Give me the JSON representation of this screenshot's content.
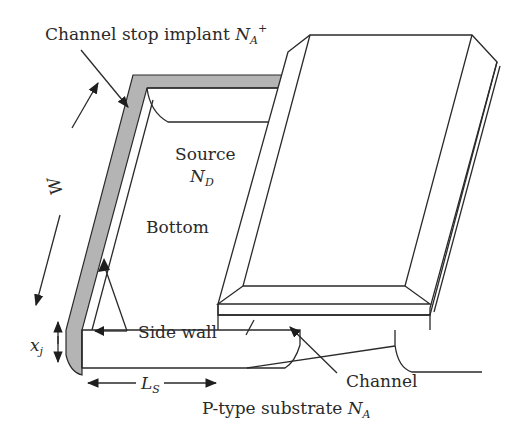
{
  "diagram": {
    "type": "MOSFET source junction 3D schematic",
    "colors": {
      "line": "#2a2a2a",
      "channel_stop": "#b4b4b4",
      "background": "#ffffff"
    },
    "labels": {
      "channel_stop": {
        "text": "Channel stop implant ",
        "symbol": "N",
        "subscript": "A",
        "superscript": "+"
      },
      "source": {
        "text": "Source",
        "symbol": "N",
        "subscript": "D"
      },
      "bottom": "Bottom",
      "width": "W",
      "junction_depth": {
        "symbol": "x",
        "subscript": "j"
      },
      "side_wall": "Side wall",
      "channel": "Channel",
      "source_length": {
        "symbol": "L",
        "subscript": "S"
      },
      "substrate": {
        "text": "P-type substrate ",
        "symbol": "N",
        "subscript": "A"
      }
    }
  }
}
